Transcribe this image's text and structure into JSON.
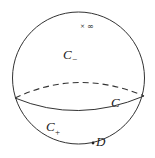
{
  "diagram": {
    "title": "",
    "sphere": {
      "stroke": "#333333"
    },
    "equator": {
      "front_style": "solid",
      "back_style": "dashed"
    },
    "labels": {
      "infinity_marker": "×",
      "infinity": "∞",
      "upper_region": "C",
      "upper_region_subscript": "−",
      "curve": "C",
      "lower_region": "C",
      "lower_region_subscript": "+",
      "point": "D"
    }
  }
}
